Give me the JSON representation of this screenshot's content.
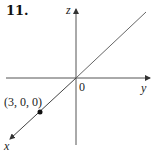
{
  "problem_number": "11.",
  "axes": {
    "x_label": "x",
    "y_label": "y",
    "z_label": "z",
    "origin_label": "0"
  },
  "point": {
    "label": "(3, 0, 0)",
    "coordinates": [
      3,
      0,
      0
    ]
  },
  "colors": {
    "axis": "#444444",
    "line": "#555555",
    "point": "#111111"
  }
}
